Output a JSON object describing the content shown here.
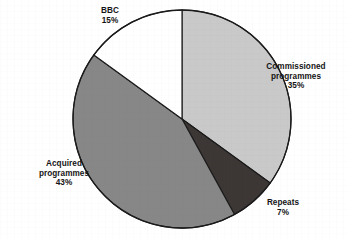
{
  "chart_data": {
    "type": "pie",
    "title": "",
    "subtitle": "",
    "xlabel": "",
    "ylabel": "",
    "legend_position": "none",
    "grid": false,
    "start_angle_deg": 0,
    "direction": "clockwise",
    "center": {
      "x": 182,
      "y": 119
    },
    "radius": 109,
    "categories": [
      "Commissioned programmes",
      "Repeats",
      "Acquired programmes",
      "BBC"
    ],
    "values": [
      35,
      7,
      43,
      15
    ],
    "unit": "%",
    "slices": [
      {
        "name": "Commissioned programmes",
        "value": 35,
        "value_label": "35%",
        "label_lines": [
          "Commissioned",
          "programmes",
          "35%"
        ],
        "color": "#c9c9c9",
        "start_deg": 0,
        "end_deg": 126
      },
      {
        "name": "Repeats",
        "value": 7,
        "value_label": "7%",
        "label_lines": [
          "Repeats",
          "7%"
        ],
        "color": "#3c3735",
        "start_deg": 126,
        "end_deg": 151.2
      },
      {
        "name": "Acquired programmes",
        "value": 43,
        "value_label": "43%",
        "label_lines": [
          "Acquired",
          "programmes",
          "43%"
        ],
        "color": "#878787",
        "start_deg": 151.2,
        "end_deg": 306
      },
      {
        "name": "BBC",
        "value": 15,
        "value_label": "15%",
        "label_lines": [
          "BBC",
          "15%"
        ],
        "color": "#ffffff",
        "start_deg": 306,
        "end_deg": 360
      }
    ]
  },
  "labels": {
    "bbc": {
      "line1": "BBC",
      "line2": "15%"
    },
    "commissioned": {
      "line1": "Commissioned",
      "line2": "programmes",
      "line3": "35%"
    },
    "acquired": {
      "line1": "Acquired",
      "line2": "programmes",
      "line3": "43%"
    },
    "repeats": {
      "line1": "Repeats",
      "line2": "7%"
    }
  },
  "colors": {
    "background": "#ffffff",
    "outline": "#1a1a1a",
    "text": "#141414",
    "slice_commissioned": "#c9c9c9",
    "slice_repeats": "#3c3735",
    "slice_acquired": "#878787",
    "slice_bbc": "#ffffff"
  }
}
